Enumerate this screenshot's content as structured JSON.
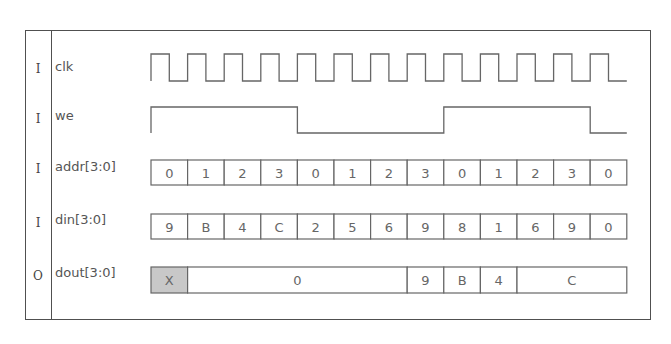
{
  "diagram": {
    "type": "timing-diagram",
    "cycles": 13,
    "colors": {
      "line": "#666666",
      "frame": "#505050",
      "unknown_fill": "#c8c8c8",
      "text": "#555555"
    },
    "signals": [
      {
        "dir": "I",
        "name": "clk",
        "kind": "clock"
      },
      {
        "dir": "I",
        "name": "we",
        "kind": "bit",
        "values": [
          1,
          1,
          1,
          1,
          0,
          0,
          0,
          0,
          1,
          1,
          1,
          1,
          0
        ]
      },
      {
        "dir": "I",
        "name": "addr[3:0]",
        "kind": "bus",
        "values": [
          "0",
          "1",
          "2",
          "3",
          "0",
          "1",
          "2",
          "3",
          "0",
          "1",
          "2",
          "3",
          "0"
        ]
      },
      {
        "dir": "I",
        "name": "din[3:0]",
        "kind": "bus",
        "values": [
          "9",
          "B",
          "4",
          "C",
          "2",
          "5",
          "6",
          "9",
          "8",
          "1",
          "6",
          "9",
          "0"
        ]
      },
      {
        "dir": "O",
        "name": "dout[3:0]",
        "kind": "bus",
        "segments": [
          {
            "label": "X",
            "start": 0,
            "len": 1,
            "unknown": true
          },
          {
            "label": "0",
            "start": 1,
            "len": 6
          },
          {
            "label": "9",
            "start": 7,
            "len": 1
          },
          {
            "label": "B",
            "start": 8,
            "len": 1
          },
          {
            "label": "4",
            "start": 9,
            "len": 1
          },
          {
            "label": "C",
            "start": 10,
            "len": 3
          }
        ]
      }
    ]
  }
}
